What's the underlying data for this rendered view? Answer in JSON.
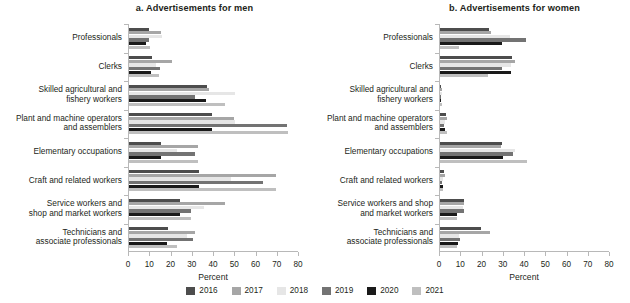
{
  "figure": {
    "xaxis_title": "Percent"
  },
  "legend": {
    "position": "bottom-center",
    "entries": [
      {
        "label": "2016",
        "color": "#4d4d4d"
      },
      {
        "label": "2017",
        "color": "#a6a6a6"
      },
      {
        "label": "2018",
        "color": "#e6e6e6"
      },
      {
        "label": "2019",
        "color": "#737373"
      },
      {
        "label": "2020",
        "color": "#1a1a1a"
      },
      {
        "label": "2021",
        "color": "#bfbfbf"
      }
    ]
  },
  "chart_data": [
    {
      "type": "bar",
      "orientation": "horizontal",
      "title": "a. Advertisements for men",
      "xlabel": "Percent",
      "ylabel": "",
      "xlim": [
        0,
        80
      ],
      "xticks": [
        0,
        10,
        20,
        30,
        40,
        50,
        60,
        70,
        80
      ],
      "grid": false,
      "categories": [
        "Professionals",
        "Clerks",
        "Skilled agricultural and\nfishery workers",
        "Plant and machine operators\nand assemblers",
        "Elementary occupations",
        "Craft and related workers",
        "Service workers and\nshop and market workers",
        "Technicians and\nassociate professionals"
      ],
      "series": [
        {
          "name": "2016",
          "color": "#4d4d4d",
          "values": [
            9.5,
            11.0,
            36.5,
            39.0,
            15.0,
            33.0,
            24.0,
            18.5
          ]
        },
        {
          "name": "2017",
          "color": "#a6a6a6",
          "values": [
            15.0,
            20.0,
            37.5,
            49.5,
            32.5,
            69.0,
            45.0,
            31.0
          ]
        },
        {
          "name": "2018",
          "color": "#e6e6e6",
          "values": [
            15.5,
            12.5,
            50.0,
            50.0,
            22.5,
            48.0,
            35.5,
            27.5
          ]
        },
        {
          "name": "2019",
          "color": "#737373",
          "values": [
            9.5,
            14.5,
            31.0,
            74.5,
            31.0,
            63.0,
            29.0,
            30.0
          ]
        },
        {
          "name": "2020",
          "color": "#1a1a1a",
          "values": [
            8.0,
            10.5,
            36.0,
            39.0,
            15.0,
            33.0,
            24.0,
            18.0
          ]
        },
        {
          "name": "2021",
          "color": "#bfbfbf",
          "values": [
            10.0,
            14.0,
            45.0,
            75.0,
            32.5,
            69.0,
            29.0,
            22.5
          ]
        }
      ]
    },
    {
      "type": "bar",
      "orientation": "horizontal",
      "title": "b. Advertisements for women",
      "xlabel": "Percent",
      "ylabel": "",
      "xlim": [
        0,
        80
      ],
      "xticks": [
        0,
        10,
        20,
        30,
        40,
        50,
        60,
        70,
        80
      ],
      "grid": false,
      "categories": [
        "Professionals",
        "Clerks",
        "Skilled agricultural and\nfishery workers",
        "Plant and machine operators\nand assemblers",
        "Elementary occupations",
        "Craft and related workers",
        "Service workers and shop\nand market workers",
        "Technicians and\nassociate professionals"
      ],
      "series": [
        {
          "name": "2016",
          "color": "#4d4d4d",
          "values": [
            23.0,
            34.0,
            0.6,
            3.0,
            29.0,
            2.0,
            11.5,
            19.5
          ]
        },
        {
          "name": "2017",
          "color": "#a6a6a6",
          "values": [
            24.0,
            35.5,
            1.0,
            3.5,
            28.5,
            2.2,
            11.5,
            23.5
          ]
        },
        {
          "name": "2018",
          "color": "#e6e6e6",
          "values": [
            33.0,
            33.5,
            0.8,
            2.5,
            35.5,
            1.5,
            11.0,
            9.0
          ]
        },
        {
          "name": "2019",
          "color": "#737373",
          "values": [
            40.5,
            29.0,
            0.5,
            2.0,
            34.5,
            1.0,
            11.5,
            9.5
          ]
        },
        {
          "name": "2020",
          "color": "#1a1a1a",
          "values": [
            29.0,
            33.5,
            0.4,
            2.5,
            29.5,
            1.5,
            8.0,
            8.5
          ]
        },
        {
          "name": "2021",
          "color": "#bfbfbf",
          "values": [
            9.0,
            22.5,
            0.8,
            3.5,
            41.0,
            1.2,
            8.0,
            8.0
          ]
        }
      ]
    }
  ]
}
